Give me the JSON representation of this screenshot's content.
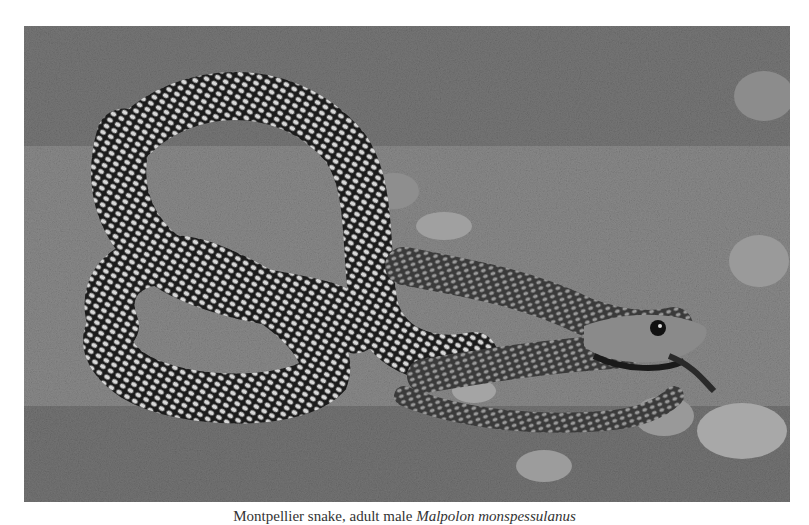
{
  "figure": {
    "image_alt": "Grayscale photograph of a coiled snake on grassy, rocky ground",
    "subject": "snake",
    "tone": "grayscale"
  },
  "caption": {
    "text_prefix": "Montpellier snake, adult male",
    "scientific_name": "Malpolon monspessulanus"
  },
  "colors": {
    "page_background": "#ffffff",
    "caption_text": "#333333"
  }
}
